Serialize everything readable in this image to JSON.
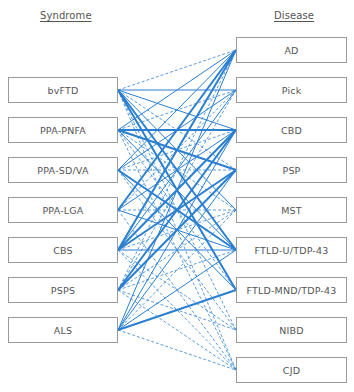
{
  "headers": {
    "syndrome": "Syndrome",
    "disease": "Disease"
  },
  "syndromes": [
    {
      "label": "bvFTD"
    },
    {
      "label": "PPA-PNFA"
    },
    {
      "label": "PPA-SD/VA"
    },
    {
      "label": "PPA-LGA"
    },
    {
      "label": "CBS"
    },
    {
      "label": "PSPS"
    },
    {
      "label": "ALS"
    }
  ],
  "diseases": [
    {
      "label": "AD"
    },
    {
      "label": "Pick"
    },
    {
      "label": "CBD"
    },
    {
      "label": "PSP"
    },
    {
      "label": "MST"
    },
    {
      "label": "FTLD-U/TDP-43"
    },
    {
      "label": "FTLD-MND/TDP-43"
    },
    {
      "label": "NIBD"
    },
    {
      "label": "CJD"
    }
  ],
  "colors": {
    "edge": "#2a7fd0",
    "box_border": "#9a9a9a",
    "text": "#555555"
  },
  "edge_legend": {
    "thick_solid": "strong association",
    "thin_solid": "association",
    "dashed": "rare association"
  },
  "edges": [
    {
      "from": 0,
      "to": 0,
      "style": "dashed"
    },
    {
      "from": 0,
      "to": 1,
      "style": "solid"
    },
    {
      "from": 0,
      "to": 2,
      "style": "solid"
    },
    {
      "from": 0,
      "to": 3,
      "style": "dashed"
    },
    {
      "from": 0,
      "to": 4,
      "style": "solid"
    },
    {
      "from": 0,
      "to": 5,
      "style": "thick"
    },
    {
      "from": 0,
      "to": 6,
      "style": "thick"
    },
    {
      "from": 0,
      "to": 7,
      "style": "dashed"
    },
    {
      "from": 0,
      "to": 8,
      "style": "dashed"
    },
    {
      "from": 1,
      "to": 0,
      "style": "solid"
    },
    {
      "from": 1,
      "to": 1,
      "style": "dashed"
    },
    {
      "from": 1,
      "to": 2,
      "style": "thick"
    },
    {
      "from": 1,
      "to": 3,
      "style": "thick"
    },
    {
      "from": 1,
      "to": 4,
      "style": "dashed"
    },
    {
      "from": 1,
      "to": 5,
      "style": "solid"
    },
    {
      "from": 1,
      "to": 6,
      "style": "dashed"
    },
    {
      "from": 1,
      "to": 8,
      "style": "dashed"
    },
    {
      "from": 2,
      "to": 0,
      "style": "solid"
    },
    {
      "from": 2,
      "to": 1,
      "style": "solid"
    },
    {
      "from": 2,
      "to": 2,
      "style": "dashed"
    },
    {
      "from": 2,
      "to": 3,
      "style": "dashed"
    },
    {
      "from": 2,
      "to": 5,
      "style": "thick"
    },
    {
      "from": 2,
      "to": 6,
      "style": "solid"
    },
    {
      "from": 2,
      "to": 7,
      "style": "dashed"
    },
    {
      "from": 3,
      "to": 0,
      "style": "thick"
    },
    {
      "from": 3,
      "to": 1,
      "style": "dashed"
    },
    {
      "from": 3,
      "to": 2,
      "style": "solid"
    },
    {
      "from": 3,
      "to": 4,
      "style": "dashed"
    },
    {
      "from": 3,
      "to": 5,
      "style": "solid"
    },
    {
      "from": 3,
      "to": 8,
      "style": "dashed"
    },
    {
      "from": 4,
      "to": 0,
      "style": "thick"
    },
    {
      "from": 4,
      "to": 1,
      "style": "solid"
    },
    {
      "from": 4,
      "to": 2,
      "style": "thick"
    },
    {
      "from": 4,
      "to": 3,
      "style": "thick"
    },
    {
      "from": 4,
      "to": 4,
      "style": "dashed"
    },
    {
      "from": 4,
      "to": 5,
      "style": "solid"
    },
    {
      "from": 4,
      "to": 7,
      "style": "dashed"
    },
    {
      "from": 4,
      "to": 8,
      "style": "dashed"
    },
    {
      "from": 5,
      "to": 0,
      "style": "dashed"
    },
    {
      "from": 5,
      "to": 1,
      "style": "dashed"
    },
    {
      "from": 5,
      "to": 2,
      "style": "thick"
    },
    {
      "from": 5,
      "to": 3,
      "style": "thick"
    },
    {
      "from": 5,
      "to": 4,
      "style": "dashed"
    },
    {
      "from": 5,
      "to": 5,
      "style": "dashed"
    },
    {
      "from": 5,
      "to": 7,
      "style": "dashed"
    },
    {
      "from": 5,
      "to": 8,
      "style": "dashed"
    },
    {
      "from": 6,
      "to": 0,
      "style": "solid"
    },
    {
      "from": 6,
      "to": 2,
      "style": "solid"
    },
    {
      "from": 6,
      "to": 3,
      "style": "solid"
    },
    {
      "from": 6,
      "to": 4,
      "style": "dashed"
    },
    {
      "from": 6,
      "to": 5,
      "style": "solid"
    },
    {
      "from": 6,
      "to": 6,
      "style": "thick"
    },
    {
      "from": 6,
      "to": 8,
      "style": "dashed"
    }
  ]
}
